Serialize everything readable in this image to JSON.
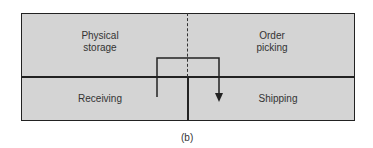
{
  "diagram": {
    "zones": [
      {
        "id": "physical-storage",
        "label_line1": "Physical",
        "label_line2": "storage"
      },
      {
        "id": "order-picking",
        "label_line1": "Order",
        "label_line2": "picking"
      },
      {
        "id": "receiving",
        "label": "Receiving"
      },
      {
        "id": "shipping",
        "label": "Shipping"
      }
    ],
    "flow": {
      "from": "receiving",
      "to": "shipping",
      "arrow": "down-arrow"
    },
    "caption": "(b)"
  }
}
